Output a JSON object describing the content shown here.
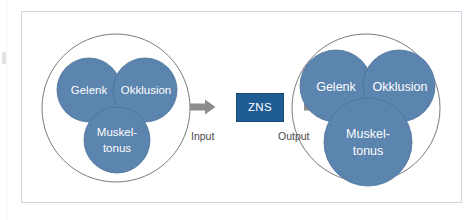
{
  "figure": {
    "colors": {
      "bubble_fill": "#5b84ae",
      "bubble_stroke": "#4a7099",
      "outer_circle_stroke": "#6b6b6b",
      "frame_border": "#ccd7e3",
      "arrow_gray": "#8c8c8c",
      "zns_box_fill": "#1f5c96",
      "label_text": "#ffffff",
      "caption_text": "#4a4a4a",
      "background": "#ffffff"
    },
    "input_diagram": {
      "name": "input-state",
      "bubbles": [
        {
          "id": "gelenk",
          "label": "Gelenk"
        },
        {
          "id": "okklusion",
          "label": "Okklusion"
        },
        {
          "id": "muskeltonus",
          "label_line1": "Muskel-",
          "label_line2": "tonus"
        }
      ]
    },
    "output_diagram": {
      "name": "output-state",
      "bubbles": [
        {
          "id": "gelenk",
          "label": "Gelenk"
        },
        {
          "id": "okklusion",
          "label": "Okklusion"
        },
        {
          "id": "muskeltonus",
          "label_line1": "Muskel-",
          "label_line2": "tonus"
        }
      ]
    },
    "flow": {
      "input_caption": "Input",
      "output_caption": "Output",
      "processor_label": "ZNS",
      "arrow_in_icon": "right-arrow-icon",
      "arrow_out_icon": "right-arrow-icon"
    }
  }
}
